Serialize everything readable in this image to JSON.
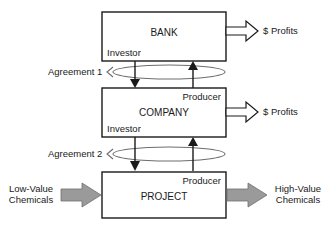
{
  "diagram": {
    "colors": {
      "stroke": "#1a1a1a",
      "ellipse_stroke": "#6d6d6d",
      "gray_arrow_fill": "#9a9a9a",
      "background": "#ffffff"
    },
    "boxes": [
      {
        "id": "bank",
        "label": "BANK",
        "role_bottom_left": "Investor",
        "role_top_right": ""
      },
      {
        "id": "company",
        "label": "COMPANY",
        "role_bottom_left": "Investor",
        "role_top_right": "Producer"
      },
      {
        "id": "project",
        "label": "PROJECT",
        "role_bottom_left": "",
        "role_top_right": "Producer"
      }
    ],
    "agreements": [
      {
        "id": "agreement-1",
        "label": "Agreement 1"
      },
      {
        "id": "agreement-2",
        "label": "Agreement 2"
      }
    ],
    "outputs": [
      {
        "id": "bank-profits",
        "label": "$ Profits"
      },
      {
        "id": "company-profits",
        "label": "$ Profits"
      }
    ],
    "material_flow": {
      "input_line1": "Low-Value",
      "input_line2": "Chemicals",
      "output_line1": "High-Value",
      "output_line2": "Chemicals"
    }
  }
}
